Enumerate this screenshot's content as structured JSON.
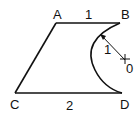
{
  "diagram": {
    "points": {
      "A": {
        "label": "A",
        "x": 56,
        "y": 23
      },
      "B": {
        "label": "B",
        "x": 120,
        "y": 23
      },
      "C": {
        "label": "C",
        "x": 15,
        "y": 93
      },
      "D": {
        "label": "D",
        "x": 122,
        "y": 93
      },
      "O": {
        "label": "0",
        "x": 125,
        "y": 60
      }
    },
    "segments": [
      {
        "from": "A",
        "to": "B",
        "length_label": "1"
      },
      {
        "from": "C",
        "to": "D",
        "length_label": "2"
      },
      {
        "from": "A",
        "to": "C"
      }
    ],
    "arc": {
      "from": "B",
      "to": "D",
      "center": "O",
      "radius_label": "1"
    },
    "stroke_color": "#111111"
  }
}
